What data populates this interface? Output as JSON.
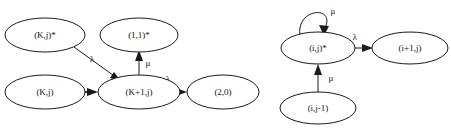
{
  "figure": {
    "type": "state-transition-diagram-pair",
    "background_color": "#ffffff",
    "stroke_color": "#1a1a1a",
    "text_color": "#111111",
    "diagrams": [
      {
        "id": "left-diagram",
        "name": "left-state-transition-diagram",
        "nodes": [
          {
            "id": "n-kj-star",
            "label": "(K,j)*",
            "cx": 45,
            "cy": 35,
            "rx": 40,
            "ry": 17
          },
          {
            "id": "n-11-star",
            "label": "(1,1)*",
            "cx": 139,
            "cy": 35,
            "rx": 39,
            "ry": 17
          },
          {
            "id": "n-kj",
            "label": "(K,j)",
            "cx": 45,
            "cy": 92,
            "rx": 40,
            "ry": 17
          },
          {
            "id": "n-k1j",
            "label": "(K+1,j)",
            "cx": 139,
            "cy": 92,
            "rx": 41,
            "ry": 17
          },
          {
            "id": "n-20",
            "label": "(2,0)",
            "cx": 223,
            "cy": 92,
            "rx": 36,
            "ry": 17
          }
        ],
        "edges": [
          {
            "id": "e-kjstar-k1j",
            "from": "(K,j)*",
            "to": "(K+1,j)",
            "label": "λ",
            "label_x": 92,
            "label_y": 60
          },
          {
            "id": "e-kj-k1j",
            "from": "(K,j)",
            "to": "(K+1,j)",
            "label": "λ",
            "label_x": 64,
            "label_y": 83
          },
          {
            "id": "e-k1j-11star",
            "from": "(K+1,j)",
            "to": "(1,1)*",
            "label": "μ",
            "label_x": 148,
            "label_y": 63
          },
          {
            "id": "e-k1j-20",
            "from": "(K+1,j)",
            "to": "(2,0)",
            "label": "λ",
            "label_x": 168,
            "label_y": 80
          }
        ]
      },
      {
        "id": "right-diagram",
        "name": "right-state-transition-diagram",
        "nodes": [
          {
            "id": "n-ij-star",
            "label": "(i,j)*",
            "cx": 318,
            "cy": 48,
            "rx": 37,
            "ry": 16
          },
          {
            "id": "n-i1j",
            "label": "(i+1,j)",
            "cx": 410,
            "cy": 48,
            "rx": 38,
            "ry": 16
          },
          {
            "id": "n-ij-1",
            "label": "(i,j-1)",
            "cx": 318,
            "cy": 108,
            "rx": 38,
            "ry": 16
          }
        ],
        "edges": [
          {
            "id": "e-ijstar-self",
            "from": "(i,j)*",
            "to": "(i,j)*",
            "label": "μ",
            "label_x": 332,
            "label_y": 12,
            "self_loop": true
          },
          {
            "id": "e-ijstar-i1j",
            "from": "(i,j)*",
            "to": "(i+1,j)",
            "label": "λ",
            "label_x": 355,
            "label_y": 38
          },
          {
            "id": "e-ij1-ijstar",
            "from": "(i,j-1)",
            "to": "(i,j)*",
            "label": "μ",
            "label_x": 330,
            "label_y": 79
          }
        ]
      }
    ]
  }
}
